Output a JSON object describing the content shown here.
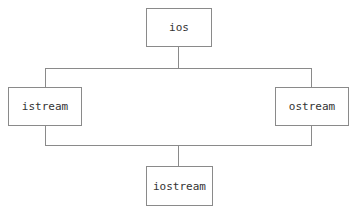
{
  "diagram": {
    "type": "class-hierarchy",
    "nodes": [
      {
        "id": "ios",
        "label": "ios"
      },
      {
        "id": "istream",
        "label": "istream"
      },
      {
        "id": "ostream",
        "label": "ostream"
      },
      {
        "id": "iostream",
        "label": "iostream"
      }
    ],
    "edges": [
      {
        "from": "ios",
        "to": "istream"
      },
      {
        "from": "ios",
        "to": "ostream"
      },
      {
        "from": "istream",
        "to": "iostream"
      },
      {
        "from": "ostream",
        "to": "iostream"
      }
    ],
    "colors": {
      "line": "#8a8a8a",
      "text": "#333333",
      "background": "#ffffff"
    }
  }
}
